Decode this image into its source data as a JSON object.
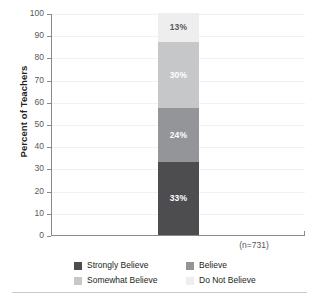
{
  "chart_data": {
    "type": "bar",
    "title": "",
    "subtitle": "",
    "xlabel": "",
    "ylabel": "Percent of Teachers",
    "categories": [
      "(n=731)"
    ],
    "ylim": [
      0,
      100
    ],
    "ytick_labels": [
      "100",
      "90",
      "80",
      "70",
      "60",
      "50",
      "40",
      "30",
      "20",
      "10",
      "0"
    ],
    "ytick_values": [
      100,
      90,
      80,
      70,
      60,
      50,
      40,
      30,
      20,
      10,
      0
    ],
    "grid": true,
    "stacked": true,
    "legend_position": "bottom",
    "series": [
      {
        "name": "Strongly Believe",
        "values": [
          33
        ],
        "data_label": "33%",
        "color": "#4d4d4f",
        "label_color": "#ffffff"
      },
      {
        "name": "Believe",
        "values": [
          24
        ],
        "data_label": "24%",
        "color": "#939598",
        "label_color": "#ffffff"
      },
      {
        "name": "Somewhat Believe",
        "values": [
          30
        ],
        "data_label": "30%",
        "color": "#c6c7c9",
        "label_color": "#ffffff"
      },
      {
        "name": "Do Not Believe",
        "values": [
          13
        ],
        "data_label": "13%",
        "color": "#eeeeef",
        "label_color": "#58595b"
      }
    ],
    "annotations": [
      "(n=731)"
    ]
  },
  "axis": {
    "y_title": "Percent of Teachers",
    "ticks": [
      {
        "label": "100"
      },
      {
        "label": "90"
      },
      {
        "label": "80"
      },
      {
        "label": "70"
      },
      {
        "label": "60"
      },
      {
        "label": "50"
      },
      {
        "label": "40"
      },
      {
        "label": "30"
      },
      {
        "label": "20"
      },
      {
        "label": "10"
      },
      {
        "label": "0"
      }
    ]
  },
  "bar": {
    "category": "(n=731)",
    "segments": [
      {
        "label": "13%",
        "name": "Do Not Believe"
      },
      {
        "label": "30%",
        "name": "Somewhat Believe"
      },
      {
        "label": "24%",
        "name": "Believe"
      },
      {
        "label": "33%",
        "name": "Strongly Believe"
      }
    ]
  },
  "legend": {
    "items": [
      {
        "label": "Strongly Believe",
        "color": "#4d4d4f"
      },
      {
        "label": "Believe",
        "color": "#939598"
      },
      {
        "label": "Somewhat Believe",
        "color": "#c6c7c9"
      },
      {
        "label": "Do Not Believe",
        "color": "#eeeeef"
      }
    ]
  }
}
